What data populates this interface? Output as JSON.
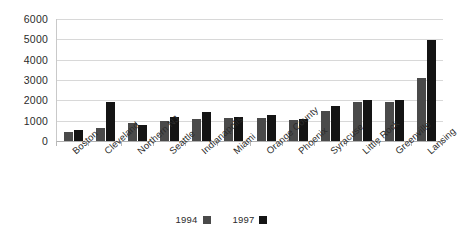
{
  "chart_data": {
    "type": "bar",
    "title": "",
    "subtitle": "",
    "xlabel": "",
    "ylabel": "",
    "ylim": [
      0,
      6000
    ],
    "ytick_step": 1000,
    "yticks": [
      6000,
      5000,
      4000,
      3000,
      2000,
      1000,
      0
    ],
    "ytick_labels": [
      "6000",
      "5000",
      "4000",
      "3000",
      "2000",
      "1000",
      "0"
    ],
    "grid": true,
    "grid_axis": "y",
    "legend_position": "bottom-center",
    "categories": [
      "Boston",
      "Cleveland",
      "Northern NJ",
      "Seattle",
      "Indianapolis",
      "Miami",
      "Orange County",
      "Phoenix",
      "Syracuse",
      "Little Rock",
      "Greenville",
      "Lansing"
    ],
    "series": [
      {
        "name": "1994",
        "color": "#4a4a4a",
        "values": [
          450,
          620,
          900,
          1000,
          1100,
          1150,
          1150,
          1050,
          1500,
          1900,
          1900,
          3100
        ]
      },
      {
        "name": "1997",
        "color": "#141414",
        "values": [
          520,
          1900,
          780,
          1200,
          1450,
          1200,
          1300,
          1100,
          1700,
          2000,
          2000,
          4950
        ]
      }
    ]
  },
  "legend": {
    "items": [
      {
        "label": "1994",
        "swatch": "legend-swatch-1994"
      },
      {
        "label": "1997",
        "swatch": "legend-swatch-1997"
      }
    ]
  }
}
